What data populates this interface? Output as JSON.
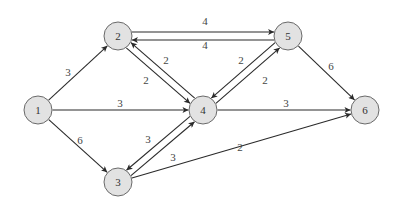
{
  "diagram": {
    "type": "directed-weighted-graph",
    "colors": {
      "node_fill": "#e2e2e2",
      "node_stroke": "#6a6a6a",
      "edge": "#2a2a2a",
      "text": "#333333"
    },
    "nodes": [
      {
        "id": "1",
        "label": "1",
        "x": 38,
        "y": 110
      },
      {
        "id": "2",
        "label": "2",
        "x": 118,
        "y": 36
      },
      {
        "id": "3",
        "label": "3",
        "x": 118,
        "y": 182
      },
      {
        "id": "4",
        "label": "4",
        "x": 203,
        "y": 110
      },
      {
        "id": "5",
        "label": "5",
        "x": 288,
        "y": 36
      },
      {
        "id": "6",
        "label": "6",
        "x": 365,
        "y": 110
      }
    ],
    "edges": [
      {
        "from": "1",
        "to": "2",
        "weight": "3",
        "offset": 0,
        "label_x": 68,
        "label_y": 72
      },
      {
        "from": "1",
        "to": "4",
        "weight": "3",
        "offset": 0,
        "label_x": 120,
        "label_y": 103
      },
      {
        "from": "1",
        "to": "3",
        "weight": "6",
        "offset": 0,
        "label_x": 80,
        "label_y": 140
      },
      {
        "from": "2",
        "to": "5",
        "weight": "4",
        "offset": -4,
        "label_x": 205,
        "label_y": 21
      },
      {
        "from": "5",
        "to": "2",
        "weight": "4",
        "offset": -4,
        "label_x": 205,
        "label_y": 45
      },
      {
        "from": "2",
        "to": "4",
        "weight": "2",
        "offset": 3.5,
        "label_x": 146,
        "label_y": 80
      },
      {
        "from": "4",
        "to": "2",
        "weight": "2",
        "offset": 3.5,
        "label_x": 166,
        "label_y": 60
      },
      {
        "from": "5",
        "to": "4",
        "weight": "2",
        "offset": 3.5,
        "label_x": 241,
        "label_y": 60
      },
      {
        "from": "4",
        "to": "5",
        "weight": "2",
        "offset": 3.5,
        "label_x": 265,
        "label_y": 80
      },
      {
        "from": "5",
        "to": "6",
        "weight": "6",
        "offset": 0,
        "label_x": 331,
        "label_y": 66
      },
      {
        "from": "4",
        "to": "6",
        "weight": "3",
        "offset": 0,
        "label_x": 286,
        "label_y": 103
      },
      {
        "from": "4",
        "to": "3",
        "weight": "3",
        "offset": 3.5,
        "label_x": 148,
        "label_y": 139
      },
      {
        "from": "3",
        "to": "4",
        "weight": "3",
        "offset": 3.5,
        "label_x": 173,
        "label_y": 157
      },
      {
        "from": "3",
        "to": "6",
        "weight": "2",
        "offset": 0,
        "label_x": 240,
        "label_y": 147
      }
    ]
  }
}
